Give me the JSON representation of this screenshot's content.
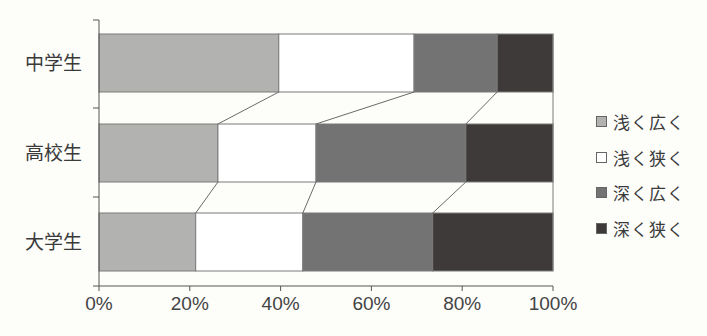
{
  "chart_data": {
    "type": "bar",
    "orientation": "horizontal",
    "stacked": true,
    "percent": true,
    "title": "",
    "xlabel": "",
    "ylabel": "",
    "xlim": [
      0,
      100
    ],
    "x_ticks": [
      "0%",
      "20%",
      "40%",
      "60%",
      "80%",
      "100%"
    ],
    "categories": [
      "中学生",
      "高校生",
      "大学生"
    ],
    "series": [
      {
        "name": "浅く広く",
        "color": "#b2b2b0",
        "values": [
          39.6,
          26.2,
          21.3
        ]
      },
      {
        "name": "浅く狭く",
        "color": "#ffffff",
        "values": [
          29.8,
          21.6,
          23.6
        ]
      },
      {
        "name": "深く広く",
        "color": "#737373",
        "values": [
          18.3,
          33.0,
          28.6
        ]
      },
      {
        "name": "深く狭く",
        "color": "#3e3a39",
        "values": [
          12.3,
          19.2,
          26.5
        ]
      }
    ],
    "connector_lines": true,
    "grid": false,
    "legend_position": "right"
  },
  "legend": {
    "items": [
      {
        "label": "浅く広く",
        "color": "#b2b2b0"
      },
      {
        "label": "浅く狭く",
        "color": "#ffffff"
      },
      {
        "label": "深く広く",
        "color": "#737373"
      },
      {
        "label": "深く狭く",
        "color": "#3e3a39"
      }
    ]
  }
}
